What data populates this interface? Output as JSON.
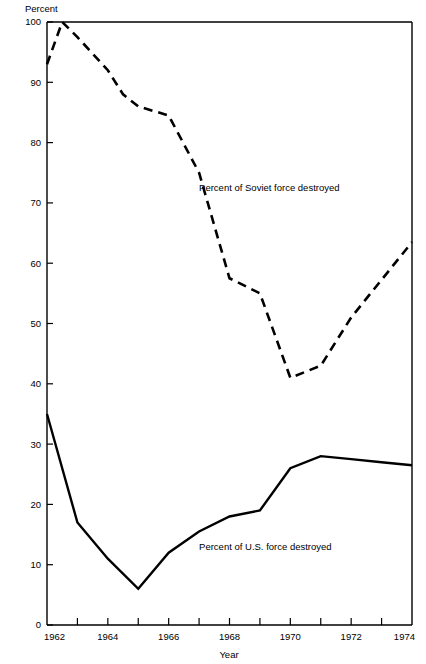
{
  "chart_data": {
    "type": "line",
    "title": "",
    "subtitle": "",
    "xlabel": "Year",
    "ylabel": "Percent",
    "xlim": [
      1962,
      1974
    ],
    "ylim": [
      0,
      100
    ],
    "grid": false,
    "legend_position": "inline-annotation",
    "x": [
      1962,
      1963,
      1964,
      1965,
      1966,
      1967,
      1968,
      1969,
      1970,
      1971,
      1972,
      1973,
      1974
    ],
    "xtick_labels": [
      "1962",
      "1964",
      "1966",
      "1968",
      "1970",
      "1972",
      "1974"
    ],
    "xtick_values": [
      1962,
      1964,
      1966,
      1968,
      1970,
      1972,
      1974
    ],
    "xminor_tick_values": [
      1963,
      1965,
      1967,
      1969,
      1971,
      1973
    ],
    "ytick_labels": [
      "0",
      "10",
      "20",
      "30",
      "40",
      "50",
      "60",
      "70",
      "80",
      "90",
      "100"
    ],
    "ytick_values": [
      0,
      10,
      20,
      30,
      40,
      50,
      60,
      70,
      80,
      90,
      100
    ],
    "series": [
      {
        "name": "Percent of Soviet force destroyed",
        "style": "dashed",
        "label_x": 1967.0,
        "label_y": 72.0,
        "x": [
          1962,
          1962.5,
          1963,
          1964,
          1964.5,
          1965,
          1966,
          1967,
          1968,
          1969,
          1970,
          1971,
          1972,
          1974
        ],
        "values": [
          93,
          100,
          97.5,
          92,
          88,
          86,
          84.5,
          75,
          57.5,
          55,
          41,
          43,
          51,
          63.5
        ]
      },
      {
        "name": "Percent of U.S. force destroyed",
        "style": "solid",
        "label_x": 1967.0,
        "label_y": 12.5,
        "x": [
          1962,
          1963,
          1964,
          1965,
          1966,
          1967,
          1968,
          1969,
          1970,
          1971,
          1972,
          1973,
          1974
        ],
        "values": [
          35,
          17,
          11,
          6,
          12,
          15.5,
          18,
          19,
          26,
          28,
          27.5,
          27,
          26.5
        ]
      }
    ]
  },
  "axes": {
    "y_axis_title": "Percent",
    "x_axis_title": "Year"
  },
  "annotations": {
    "soviet_label": "Percent of Soviet force destroyed",
    "us_label": "Percent of U.S. force destroyed"
  },
  "colors": {
    "ink": "#000000",
    "background": "#ffffff"
  }
}
